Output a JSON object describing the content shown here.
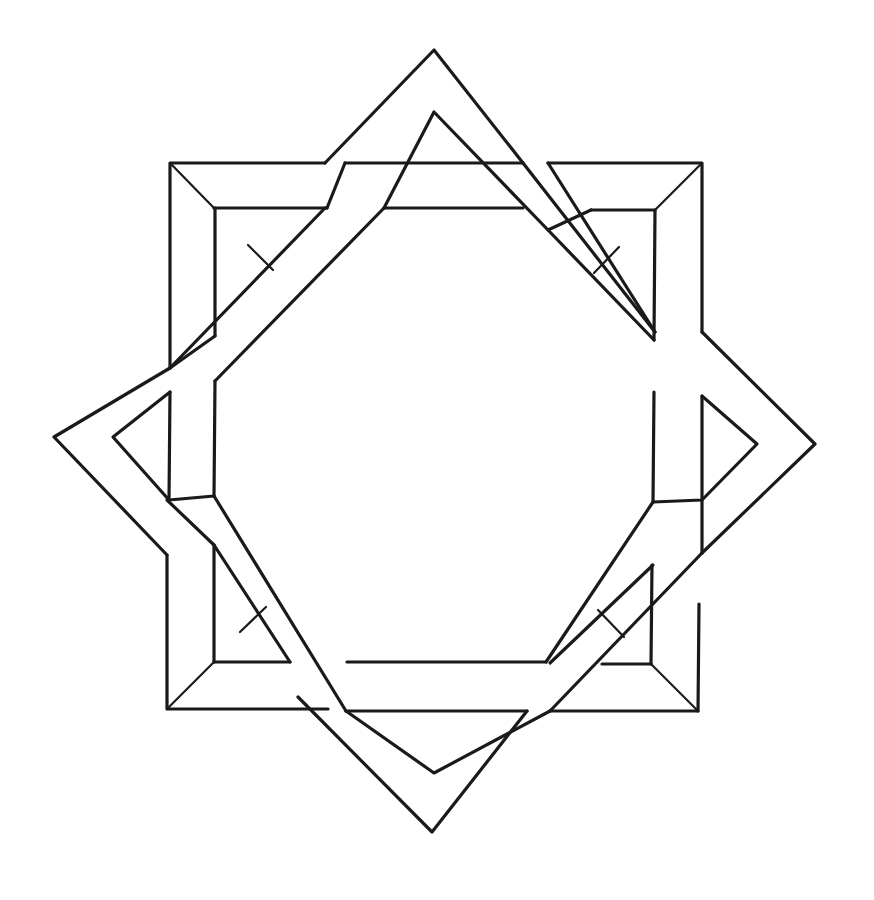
{
  "figure": {
    "title": "",
    "description": "Interlaced eight-pointed star formed by two overlapping square frames (one axis-aligned, one rotated 45 degrees), drawn in black line art on white",
    "stroke_color": "#1a1a1a",
    "background_color": "#ffffff"
  },
  "square_frame": {
    "outer": {
      "x1": 170,
      "y1": 163,
      "x2": 702,
      "y2": 711
    },
    "inner": {
      "x1": 214,
      "y1": 208,
      "x2": 655,
      "y2": 665
    }
  },
  "diamond_frame": {
    "outer": {
      "top": [
        434,
        50
      ],
      "right": [
        815,
        444
      ],
      "bottom": [
        432,
        832
      ],
      "left": [
        54,
        437
      ]
    },
    "inner": {
      "top": [
        434,
        112
      ],
      "right": [
        757,
        444
      ],
      "bottom": [
        434,
        773
      ],
      "left": [
        113,
        437
      ]
    }
  }
}
